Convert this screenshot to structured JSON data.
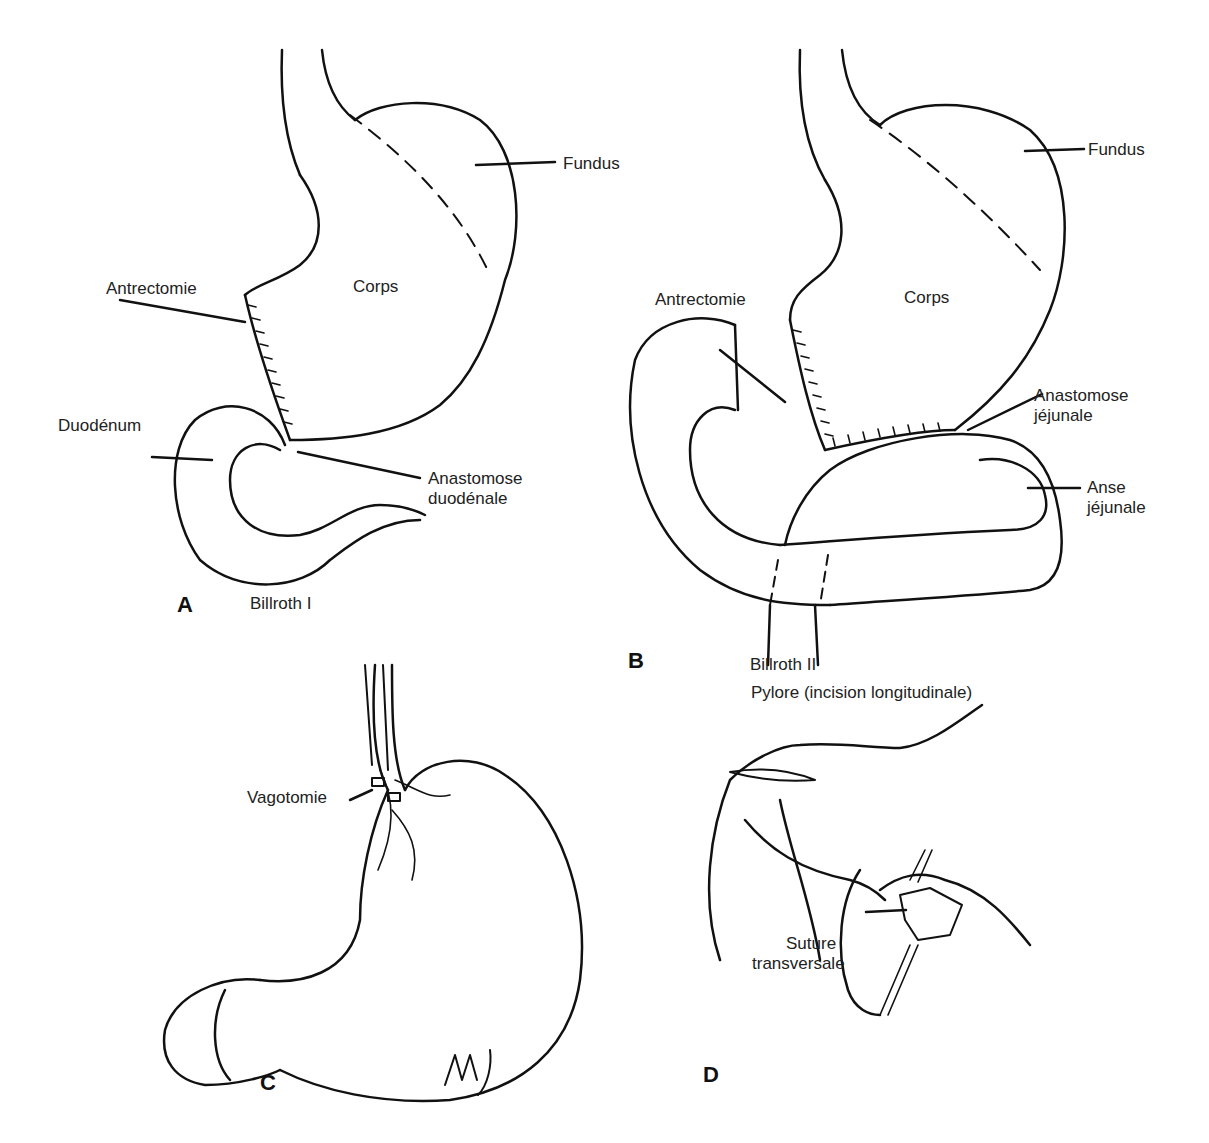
{
  "figure": {
    "panels": [
      {
        "id": "A",
        "letter": "A",
        "caption": "Billroth I",
        "labels": {
          "fundus": "Fundus",
          "corps": "Corps",
          "antrectomie": "Antrectomie",
          "duodenum": "Duodénum",
          "anastomose_line1": "Anastomose",
          "anastomose_line2": "duodénale"
        }
      },
      {
        "id": "B",
        "letter": "B",
        "caption": "Billroth II",
        "labels": {
          "fundus": "Fundus",
          "corps": "Corps",
          "antrectomie": "Antrectomie",
          "anastomose_line1": "Anastomose",
          "anastomose_line2": "jéjunale",
          "anse_line1": "Anse",
          "anse_line2": "jéjunale"
        }
      },
      {
        "id": "C",
        "letter": "C",
        "labels": {
          "vagotomie": "Vagotomie"
        },
        "signature": "M.J."
      },
      {
        "id": "D",
        "letter": "D",
        "labels": {
          "pylore": "Pylore (incision longitudinale)",
          "suture_line1": "Suture",
          "suture_line2": "transversale"
        }
      }
    ]
  }
}
